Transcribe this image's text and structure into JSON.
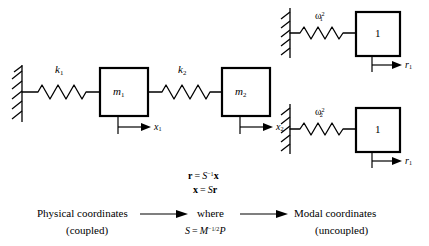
{
  "figure": {
    "background_color": "#ffffff",
    "line_color": "#000000"
  },
  "physical_system": {
    "name": "coupled two-mass spring system",
    "springs": [
      {
        "id": "k1",
        "label_base": "k",
        "label_sub": "1"
      },
      {
        "id": "k2",
        "label_base": "k",
        "label_sub": "2"
      }
    ],
    "masses": [
      {
        "id": "m1",
        "label_base": "m",
        "label_sub": "1"
      },
      {
        "id": "m2",
        "label_base": "m",
        "label_sub": "2"
      }
    ],
    "displacements": [
      {
        "id": "x1",
        "label_base": "x",
        "label_sub": "1"
      },
      {
        "id": "x2",
        "label_base": "x",
        "label_sub": "2"
      }
    ]
  },
  "modal_system": {
    "name": "uncoupled modal oscillators",
    "blocks": [
      {
        "id": "mode1",
        "spring_base": "ω",
        "spring_sup": "2",
        "spring_sub": "1",
        "mass_label": "1",
        "disp_base": "r",
        "disp_sub": "1"
      },
      {
        "id": "mode2",
        "spring_base": "ω",
        "spring_sup": "2",
        "spring_sub": "2",
        "mass_label": "1",
        "disp_base": "r",
        "disp_sub": "1"
      }
    ]
  },
  "equations": {
    "eq1": {
      "lhs": "r",
      "eq": "=",
      "rhs_base": "S",
      "rhs_sup": "−1",
      "rhs_tail": "x"
    },
    "eq2": {
      "lhs": "x",
      "eq": "=",
      "rhs_base": "S",
      "rhs_tail": "r"
    },
    "where_label": "where",
    "eq3": {
      "lhs": "S",
      "eq": "=",
      "rhs_base": "M",
      "rhs_sup": "−1/2",
      "rhs_tail": "P"
    }
  },
  "flow": {
    "left": {
      "line1": "Physical coordinates",
      "line2": "(coupled)"
    },
    "right": {
      "line1": "Modal coordinates",
      "line2": "(uncoupled)"
    },
    "arrow_left_name": "arrow-right-icon",
    "arrow_right_name": "arrow-right-icon"
  }
}
